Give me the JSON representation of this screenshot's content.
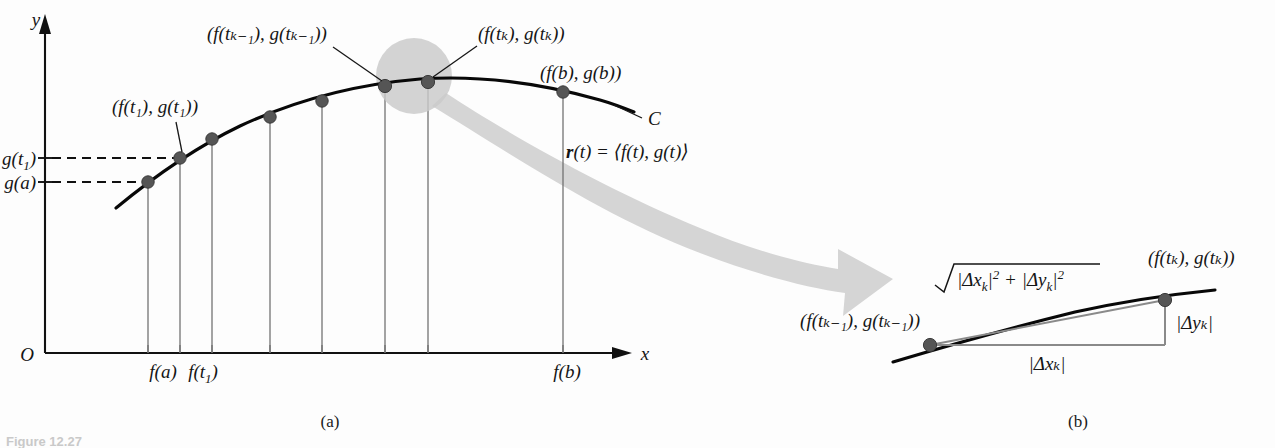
{
  "figure": {
    "title_ref": "Figure 12.27",
    "panel_a_caption": "(a)",
    "panel_b_caption": "(b)"
  },
  "panel_a": {
    "axes": {
      "x_axis_label": "x",
      "y_axis_label": "y",
      "origin_label": "O"
    },
    "y_tick_labels": [
      {
        "id": "g-t1",
        "text_main": "g(t",
        "text_sub": "1",
        "text_tail": ")",
        "y_px": 158
      },
      {
        "id": "g-a",
        "text_main": "g(a)",
        "text_sub": "",
        "text_tail": "",
        "y_px": 182
      }
    ],
    "x_tick_labels": [
      {
        "id": "f-a",
        "text_main": "f(a)",
        "text_sub": "",
        "text_tail": "",
        "x_px": 163
      },
      {
        "id": "f-t1",
        "text_main": "f(t",
        "text_sub": "1",
        "text_tail": ")",
        "x_px": 203
      },
      {
        "id": "f-b",
        "text_main": "f(b)",
        "text_sub": "",
        "text_tail": "",
        "x_px": 567
      }
    ],
    "curve_label": "C",
    "vector_equation": {
      "bold_r": "r",
      "rest": "(t) = ⟨f(t), g(t)⟩"
    },
    "point_labels": [
      {
        "id": "p-t1",
        "text": "(f(t₁), g(t₁))",
        "anchor_x": 112,
        "anchor_y": 107
      },
      {
        "id": "p-tk-1",
        "text": "(f(tₖ₋₁), g(tₖ₋₁))",
        "anchor_x": 207,
        "anchor_y": 34
      },
      {
        "id": "p-tk",
        "text": "(f(tₖ), g(tₖ))",
        "anchor_x": 478,
        "anchor_y": 34
      },
      {
        "id": "p-b",
        "text": "(f(b), g(b))",
        "anchor_x": 540,
        "anchor_y": 73
      }
    ],
    "partition_points": [
      {
        "label": "f(a)",
        "x": 148,
        "y": 182
      },
      {
        "label": "f(t1)",
        "x": 180,
        "y": 158
      },
      {
        "label": "f(t2)",
        "x": 212,
        "y": 139
      },
      {
        "label": "f(t3)",
        "x": 270,
        "y": 117
      },
      {
        "label": "f(t4)",
        "x": 322,
        "y": 101
      },
      {
        "label": "f(t_{k-1})",
        "x": 385,
        "y": 86
      },
      {
        "label": "f(t_k)",
        "x": 428,
        "y": 82
      },
      {
        "label": "f(b)",
        "x": 563,
        "y": 92
      }
    ],
    "magnifier_circle": {
      "cx": 414,
      "cy": 76,
      "r": 38
    }
  },
  "panel_b": {
    "hypotenuse_label": {
      "radicand_x": "|Δx",
      "sub_k1": "k",
      "radicand_x_tail": "|",
      "sup2_a": "2",
      "plus": "+",
      "radicand_y": "|Δy",
      "sub_k2": "k",
      "radicand_y_tail": "|",
      "sup2_b": "2",
      "full_text": "√(|Δxₖ|² + |Δyₖ|²)"
    },
    "point_label_left": "(f(tₖ₋₁), g(tₖ₋₁))",
    "point_label_right": "(f(tₖ), g(tₖ))",
    "leg_horizontal_label": "|Δxₖ|",
    "leg_vertical_label": "|Δyₖ|",
    "points": [
      {
        "id": "left-point",
        "x": 930,
        "y": 345
      },
      {
        "id": "right-point",
        "x": 1165,
        "y": 300
      }
    ]
  },
  "colors": {
    "ink": "#111111",
    "curve": "#080808",
    "dropline_gray": "#6e6e6e",
    "point_fill": "#555555",
    "magnifier_gray": "#c9c9c9",
    "arrow_gray": "#d5d5d5",
    "background": "#fdfdfd"
  }
}
